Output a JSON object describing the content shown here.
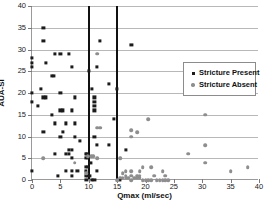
{
  "chart_data": {
    "type": "scatter",
    "title": "",
    "xlabel": "Qmax (ml/sec)",
    "ylabel": "AUA-SI",
    "xlim": [
      0,
      40
    ],
    "ylim": [
      0,
      40
    ],
    "xticks": [
      0,
      5,
      10,
      15,
      20,
      25,
      30,
      35,
      40
    ],
    "yticks": [
      0,
      5,
      10,
      15,
      20,
      25,
      30,
      35,
      40
    ],
    "grid": "horizontal",
    "legend_position": "right",
    "annotations": {
      "vertical_reference_lines": [
        10,
        15
      ]
    },
    "series": [
      {
        "name": "Stricture Present",
        "marker": "square",
        "color": "#1b1b1b",
        "points": [
          [
            2,
            35
          ],
          [
            2,
            32
          ],
          [
            12,
            32
          ],
          [
            17.5,
            31
          ],
          [
            4,
            29
          ],
          [
            5,
            29
          ],
          [
            6.5,
            29
          ],
          [
            0,
            28
          ],
          [
            0,
            27
          ],
          [
            2.5,
            27
          ],
          [
            0,
            26
          ],
          [
            7,
            26
          ],
          [
            11.5,
            26
          ],
          [
            10,
            25
          ],
          [
            3.5,
            24
          ],
          [
            3.9,
            24
          ],
          [
            10.5,
            21
          ],
          [
            1.5,
            21
          ],
          [
            15,
            21
          ],
          [
            13.5,
            22
          ],
          [
            0,
            20
          ],
          [
            5,
            20
          ],
          [
            0,
            18
          ],
          [
            1,
            17
          ],
          [
            2,
            19
          ],
          [
            2.5,
            19
          ],
          [
            7.5,
            19
          ],
          [
            11,
            19
          ],
          [
            11,
            18
          ],
          [
            11,
            17
          ],
          [
            3.5,
            15
          ],
          [
            5,
            16
          ],
          [
            5.5,
            16
          ],
          [
            7,
            16
          ],
          [
            11,
            16
          ],
          [
            4,
            13
          ],
          [
            6,
            13
          ],
          [
            7.5,
            13
          ],
          [
            14.5,
            14
          ],
          [
            2,
            11
          ],
          [
            5.5,
            11
          ],
          [
            5,
            10
          ],
          [
            7.5,
            10
          ],
          [
            11,
            10
          ],
          [
            8.5,
            9
          ],
          [
            11.5,
            8
          ],
          [
            13.5,
            8
          ],
          [
            16.5,
            7
          ],
          [
            4,
            6
          ],
          [
            6,
            6
          ],
          [
            6.5,
            6
          ],
          [
            9.5,
            6
          ],
          [
            9.7,
            6
          ],
          [
            7,
            5
          ],
          [
            9.5,
            5
          ],
          [
            9.8,
            5
          ],
          [
            10.3,
            4
          ],
          [
            7,
            7
          ],
          [
            6.5,
            7
          ],
          [
            9.5,
            3
          ],
          [
            9.8,
            3
          ],
          [
            6,
            2
          ],
          [
            7,
            2
          ],
          [
            8,
            2
          ],
          [
            9.5,
            2
          ],
          [
            11.5,
            2
          ],
          [
            0,
            2
          ],
          [
            4.5,
            1
          ],
          [
            7,
            1
          ],
          [
            9.5,
            1
          ],
          [
            9.8,
            1
          ],
          [
            10.2,
            1
          ],
          [
            9.6,
            0
          ],
          [
            10.5,
            0
          ],
          [
            11,
            0
          ],
          [
            15.5,
            0
          ]
        ]
      },
      {
        "name": "Stricture Absent",
        "marker": "circle",
        "color": "#8e8e8e",
        "points": [
          [
            11.5,
            29
          ],
          [
            30.5,
            15
          ],
          [
            20.5,
            14
          ],
          [
            11.5,
            12
          ],
          [
            12,
            12
          ],
          [
            17.5,
            11.5
          ],
          [
            18.5,
            11
          ],
          [
            17.5,
            10
          ],
          [
            30.5,
            8
          ],
          [
            27.5,
            6
          ],
          [
            2,
            5
          ],
          [
            11.5,
            5
          ],
          [
            15.5,
            5
          ],
          [
            7.5,
            4
          ],
          [
            30.5,
            4
          ],
          [
            38,
            3
          ],
          [
            9.8,
            5.5
          ],
          [
            10.4,
            5.5
          ],
          [
            10.8,
            5.5
          ],
          [
            19.5,
            3
          ],
          [
            21,
            3
          ],
          [
            35,
            2
          ],
          [
            16.5,
            2
          ],
          [
            17.5,
            2
          ],
          [
            19,
            2
          ],
          [
            23,
            2
          ],
          [
            9.5,
            1.5
          ],
          [
            16,
            1.5
          ],
          [
            16.5,
            1
          ],
          [
            17.5,
            1
          ],
          [
            18.5,
            1
          ],
          [
            19,
            1
          ],
          [
            21.5,
            1
          ],
          [
            23.5,
            1
          ],
          [
            15.5,
            0.5
          ],
          [
            16,
            0.5
          ],
          [
            16.5,
            0.5
          ],
          [
            17,
            0.5
          ],
          [
            18,
            0.5
          ],
          [
            18.5,
            0.5
          ],
          [
            19,
            0.5
          ],
          [
            20,
            0
          ],
          [
            20.5,
            0
          ],
          [
            21,
            0
          ],
          [
            22,
            0
          ],
          [
            22.5,
            0
          ],
          [
            23,
            0
          ],
          [
            23.5,
            0
          ],
          [
            24,
            0
          ],
          [
            15,
            0
          ],
          [
            17.5,
            0
          ],
          [
            19.5,
            0
          ]
        ]
      }
    ]
  },
  "legend": {
    "entries": [
      {
        "label": "Stricture Present"
      },
      {
        "label": "Stricture Absent"
      }
    ]
  }
}
